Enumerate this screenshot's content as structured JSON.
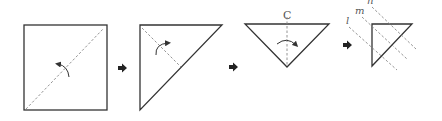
{
  "diagram": {
    "steps": [
      {
        "id": 1,
        "shape": "square",
        "fold": "diagonal"
      },
      {
        "id": 2,
        "shape": "right-triangle",
        "fold": "bisect"
      },
      {
        "id": 3,
        "shape": "inverted-triangle",
        "fold": "center",
        "label": "C"
      },
      {
        "id": 4,
        "shape": "small-triangle",
        "cut_lines": [
          "l",
          "m",
          "n"
        ]
      }
    ],
    "labels": {
      "center": "C",
      "line_l": "l",
      "line_m": "m",
      "line_n": "n"
    },
    "colors": {
      "stroke": "#333333",
      "dash": "#888888",
      "background": "#ffffff"
    }
  }
}
